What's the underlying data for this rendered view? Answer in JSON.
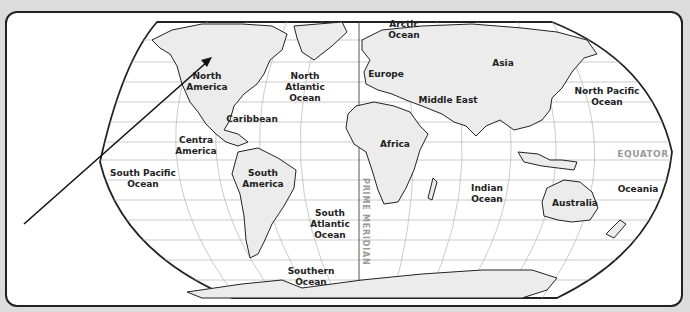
{
  "map": {
    "type": "world-continents-oceans",
    "projection": "Robinson-like",
    "labels": {
      "north_america": "North\nAmerica",
      "north_atlantic": "North\nAtlantic\nOcean",
      "arctic": "Arctic\nOcean",
      "europe": "Europe",
      "asia": "Asia",
      "middle_east": "Middle East",
      "north_pacific": "North Pacific\nOcean",
      "caribbean": "Caribbean",
      "central_america": "Centra\nAmerica",
      "south_pacific": "South Pacific\nOcean",
      "south_america": "South\nAmerica",
      "africa": "Africa",
      "south_atlantic": "South\nAtlantic\nOcean",
      "indian": "Indian\nOcean",
      "australia": "Australia",
      "oceania": "Oceania",
      "southern": "Southern\nOcean",
      "equator": "EQUATOR",
      "prime_meridian": "PRIME MERIDIAN"
    },
    "colors": {
      "land": "#ececec",
      "ocean": "#ffffff",
      "outline": "#222222",
      "grid": "#b5b5b5",
      "reference_label": "#9a9a9a",
      "background": "#dcdcdc"
    },
    "annotation": {
      "type": "arrow",
      "from": [
        22,
        222
      ],
      "to": [
        210,
        55
      ],
      "points_to": "North America"
    }
  }
}
